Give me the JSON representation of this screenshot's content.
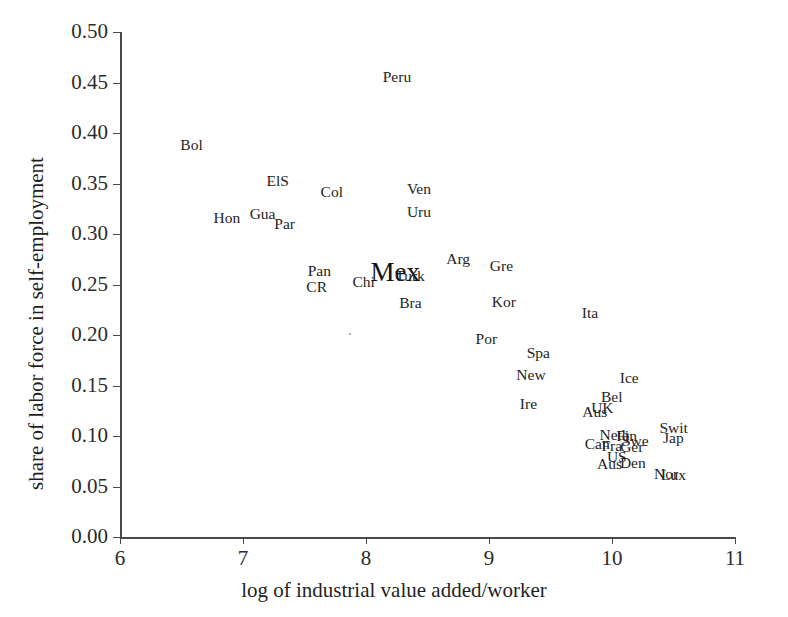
{
  "chart_data": {
    "type": "scatter",
    "title": "",
    "xlabel": "log of industrial value added/worker",
    "ylabel": "share of labor force in self-employment",
    "xlim": [
      6,
      11
    ],
    "ylim": [
      0.0,
      0.5
    ],
    "xticks": [
      "6",
      "7",
      "8",
      "9",
      "10",
      "11"
    ],
    "yticks": [
      "0.00",
      "0.05",
      "0.10",
      "0.15",
      "0.20",
      "0.25",
      "0.30",
      "0.35",
      "0.40",
      "0.45",
      "0.50"
    ],
    "grid": false,
    "legend": "none",
    "marker_style": "text-label",
    "points": [
      {
        "label": "Peru",
        "x": 8.25,
        "y": 0.455,
        "size": "normal"
      },
      {
        "label": "Bol",
        "x": 6.58,
        "y": 0.388,
        "size": "normal"
      },
      {
        "label": "ElS",
        "x": 7.28,
        "y": 0.352,
        "size": "normal"
      },
      {
        "label": "Col",
        "x": 7.72,
        "y": 0.342,
        "size": "normal"
      },
      {
        "label": "Ven",
        "x": 8.43,
        "y": 0.345,
        "size": "normal"
      },
      {
        "label": "Uru",
        "x": 8.43,
        "y": 0.322,
        "size": "normal"
      },
      {
        "label": "Hon",
        "x": 6.87,
        "y": 0.316,
        "size": "normal"
      },
      {
        "label": "Gua",
        "x": 7.16,
        "y": 0.32,
        "size": "normal"
      },
      {
        "label": "Par",
        "x": 7.34,
        "y": 0.31,
        "size": "normal"
      },
      {
        "label": "Arg",
        "x": 8.75,
        "y": 0.275,
        "size": "normal"
      },
      {
        "label": "Gre",
        "x": 9.1,
        "y": 0.268,
        "size": "normal"
      },
      {
        "label": "Pan",
        "x": 7.62,
        "y": 0.263,
        "size": "normal"
      },
      {
        "label": "Mex",
        "x": 8.24,
        "y": 0.262,
        "size": "large"
      },
      {
        "label": "Turk",
        "x": 8.36,
        "y": 0.258,
        "size": "normal"
      },
      {
        "label": "Chi",
        "x": 7.98,
        "y": 0.252,
        "size": "normal"
      },
      {
        "label": "CR",
        "x": 7.6,
        "y": 0.248,
        "size": "normal"
      },
      {
        "label": "Bra",
        "x": 8.36,
        "y": 0.232,
        "size": "normal"
      },
      {
        "label": "Kor",
        "x": 9.12,
        "y": 0.233,
        "size": "normal"
      },
      {
        "label": "Ita",
        "x": 9.82,
        "y": 0.222,
        "size": "normal"
      },
      {
        "label": "Por",
        "x": 8.98,
        "y": 0.196,
        "size": "normal"
      },
      {
        "label": "Spa",
        "x": 9.4,
        "y": 0.182,
        "size": "normal"
      },
      {
        "label": "New",
        "x": 9.34,
        "y": 0.16,
        "size": "normal"
      },
      {
        "label": "Ice",
        "x": 10.14,
        "y": 0.157,
        "size": "normal"
      },
      {
        "label": "Bel",
        "x": 10.0,
        "y": 0.139,
        "size": "normal"
      },
      {
        "label": "Ire",
        "x": 9.32,
        "y": 0.132,
        "size": "normal"
      },
      {
        "label": "UK",
        "x": 9.92,
        "y": 0.128,
        "size": "normal"
      },
      {
        "label": "Aus",
        "x": 9.86,
        "y": 0.124,
        "size": "normal"
      },
      {
        "label": "Swit",
        "x": 10.5,
        "y": 0.108,
        "size": "normal"
      },
      {
        "label": "Jap",
        "x": 10.5,
        "y": 0.098,
        "size": "normal"
      },
      {
        "label": "Neth",
        "x": 10.02,
        "y": 0.101,
        "size": "normal"
      },
      {
        "label": "Fin",
        "x": 10.12,
        "y": 0.1,
        "size": "normal"
      },
      {
        "label": "Swe",
        "x": 10.19,
        "y": 0.095,
        "size": "normal"
      },
      {
        "label": "Can",
        "x": 9.88,
        "y": 0.092,
        "size": "normal"
      },
      {
        "label": "Fra",
        "x": 10.0,
        "y": 0.09,
        "size": "normal"
      },
      {
        "label": "Ger",
        "x": 10.16,
        "y": 0.089,
        "size": "normal"
      },
      {
        "label": "US",
        "x": 10.04,
        "y": 0.079,
        "size": "normal"
      },
      {
        "label": "Aus",
        "x": 9.98,
        "y": 0.072,
        "size": "normal"
      },
      {
        "label": "Den",
        "x": 10.17,
        "y": 0.073,
        "size": "normal"
      },
      {
        "label": "Nor",
        "x": 10.44,
        "y": 0.062,
        "size": "normal"
      },
      {
        "label": "Lux",
        "x": 10.5,
        "y": 0.061,
        "size": "normal"
      }
    ]
  },
  "colors": {
    "axis": "#4a4a4a",
    "text": "#232323",
    "background": "#ffffff"
  }
}
